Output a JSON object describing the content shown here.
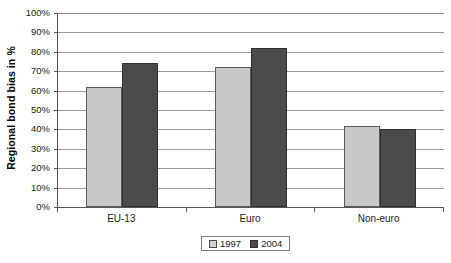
{
  "chart_data": {
    "type": "bar",
    "title": "",
    "subtitle": "",
    "xlabel": "",
    "ylabel": "Regional bond bias in %",
    "categories": [
      "EU-13",
      "Euro",
      "Non-euro"
    ],
    "series": [
      {
        "name": "1997",
        "values": [
          62,
          72,
          42
        ],
        "color": "#c9c9c9"
      },
      {
        "name": "2004",
        "values": [
          74,
          82,
          40
        ],
        "color": "#4b4b4b"
      }
    ],
    "ylim": [
      0,
      100
    ],
    "ytick_values": [
      0,
      10,
      20,
      30,
      40,
      50,
      60,
      70,
      80,
      90,
      100
    ],
    "ytick_labels": [
      "0%",
      "10%",
      "20%",
      "30%",
      "40%",
      "50%",
      "60%",
      "70%",
      "80%",
      "90%",
      "100%"
    ],
    "grid": true,
    "grid_axis": "y",
    "legend_position": "bottom-center",
    "legend_entries": [
      "1997",
      "2004"
    ],
    "annotations": []
  },
  "axes": {
    "y_title": "Regional bond bias in %"
  },
  "legend": {
    "items": [
      {
        "label": "1997",
        "swatch": "light-gray-swatch"
      },
      {
        "label": "2004",
        "swatch": "dark-gray-swatch"
      }
    ]
  },
  "colors": {
    "series_1997": "#c9c9c9",
    "series_2004": "#4b4b4b",
    "gridline": "#9a9a9a",
    "axis": "#555555",
    "background": "#ffffff",
    "text": "#1a1a1a"
  }
}
